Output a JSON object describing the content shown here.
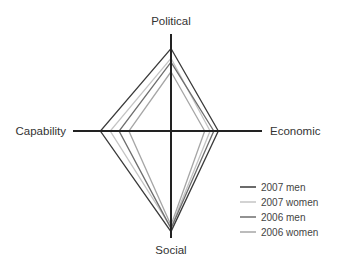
{
  "chart_data": {
    "type": "radar",
    "title": "",
    "axes": [
      "Political",
      "Economic",
      "Social",
      "Capability"
    ],
    "range": [
      0,
      1
    ],
    "grid": false,
    "legend_position": "bottom-right",
    "series": [
      {
        "name": "2007 men",
        "color": "#3a3a3a",
        "values": [
          0.85,
          0.52,
          0.94,
          0.72
        ]
      },
      {
        "name": "2007 women",
        "color": "#c4c4c4",
        "values": [
          0.75,
          0.43,
          0.9,
          0.62
        ]
      },
      {
        "name": "2006 men",
        "color": "#6e6e6e",
        "values": [
          0.71,
          0.47,
          0.91,
          0.53
        ]
      },
      {
        "name": "2006 women",
        "color": "#a6a6a6",
        "values": [
          0.61,
          0.37,
          0.88,
          0.43
        ]
      }
    ]
  }
}
